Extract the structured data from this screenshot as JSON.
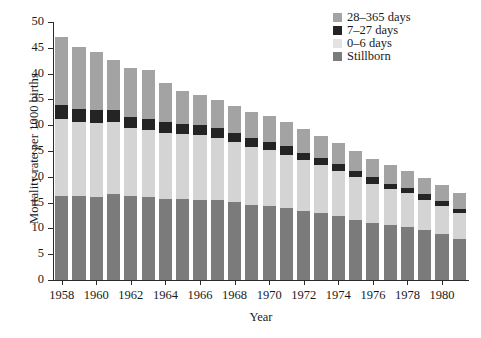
{
  "chart_data": {
    "type": "bar",
    "stacked": true,
    "title": "",
    "xlabel": "Year",
    "ylabel": "Mortality rate per 1000 births",
    "ylim": [
      0,
      50
    ],
    "ytick_step": 5,
    "yticks": [
      "0",
      "5",
      "10",
      "15",
      "20",
      "25",
      "30",
      "35",
      "40",
      "45",
      "50"
    ],
    "grid": false,
    "legend_position": "top-right",
    "xlabel_interval": 2,
    "categories": [
      "1958",
      "1959",
      "1960",
      "1961",
      "1962",
      "1963",
      "1964",
      "1965",
      "1966",
      "1967",
      "1968",
      "1969",
      "1970",
      "1971",
      "1972",
      "1973",
      "1974",
      "1975",
      "1976",
      "1977",
      "1978",
      "1979",
      "1980",
      "1981"
    ],
    "xtick_labels": [
      "1958",
      "1960",
      "1962",
      "1964",
      "1966",
      "1968",
      "1970",
      "1972",
      "1974",
      "1976",
      "1978",
      "1980"
    ],
    "series": [
      {
        "name": "Stillborn",
        "color": "#7b7b7b",
        "values": [
          16.3,
          16.3,
          16.0,
          16.6,
          16.2,
          16.1,
          15.7,
          15.7,
          15.6,
          15.5,
          15.1,
          14.5,
          14.3,
          14.0,
          13.4,
          12.9,
          12.4,
          11.6,
          11.1,
          10.6,
          10.3,
          9.6,
          8.9,
          7.9
        ]
      },
      {
        "name": "0–6 days",
        "color": "#d4d4d4",
        "values": [
          14.9,
          14.3,
          14.4,
          14.0,
          13.2,
          13.0,
          12.8,
          12.6,
          12.5,
          12.1,
          11.6,
          11.3,
          10.9,
          10.3,
          9.8,
          9.4,
          8.8,
          8.3,
          7.6,
          7.0,
          6.5,
          6.0,
          5.5,
          5.0
        ]
      },
      {
        "name": "7–27 days",
        "color": "#242424",
        "values": [
          2.7,
          2.5,
          2.5,
          2.3,
          2.2,
          2.2,
          2.1,
          2.0,
          2.0,
          1.9,
          1.8,
          1.7,
          1.6,
          1.6,
          1.5,
          1.4,
          1.3,
          1.3,
          1.2,
          1.1,
          1.1,
          1.0,
          1.0,
          0.9
        ]
      },
      {
        "name": "28–365 days",
        "color": "#a3a3a3",
        "values": [
          13.2,
          12.0,
          11.3,
          9.7,
          9.5,
          9.4,
          7.5,
          6.3,
          5.8,
          5.3,
          5.2,
          5.0,
          4.9,
          4.8,
          4.6,
          4.3,
          4.0,
          3.8,
          3.6,
          3.5,
          3.2,
          3.1,
          3.0,
          3.0
        ]
      }
    ],
    "totals": [
      47.1,
      45.1,
      44.2,
      42.6,
      41.1,
      40.7,
      38.1,
      36.6,
      35.9,
      34.8,
      33.7,
      32.5,
      31.7,
      30.7,
      29.3,
      28.0,
      26.5,
      25.0,
      23.5,
      22.2,
      21.1,
      19.7,
      18.4,
      16.8
    ]
  },
  "legend": {
    "items": [
      {
        "label": "28–365 days",
        "color": "#a3a3a3"
      },
      {
        "label": "7–27 days",
        "color": "#242424"
      },
      {
        "label": "0–6 days",
        "color": "#e3e3e3"
      },
      {
        "label": "Stillborn",
        "color": "#7b7b7b"
      }
    ]
  }
}
